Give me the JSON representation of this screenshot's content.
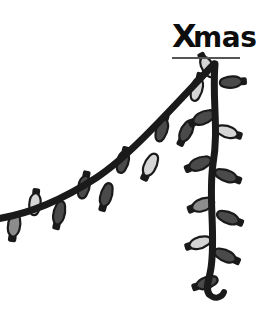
{
  "figure": {
    "background_color": "#ffffff",
    "ink_color": "#1a1a1a",
    "underline_color": "#555555",
    "bulb_light_color": "#d5d5d5",
    "bulb_mid_color": "#8c8c8c",
    "bulb_dark_color": "#4a4a4a",
    "label": {
      "text": "Xmas",
      "lead_char": "X",
      "rest_chars": "mas",
      "x": 172,
      "y": 47,
      "font_size": 28,
      "lead_font_size": 32
    },
    "baseline_rule": {
      "x1": 172,
      "x2": 240,
      "y": 58,
      "thickness": 2
    }
  },
  "chart_data": {
    "type": "line",
    "xlabel": "",
    "ylabel": "",
    "annotations": [
      "Xmas"
    ],
    "legend": [],
    "grid": false,
    "style": "hand-drawn christmas light string",
    "series": [
      {
        "name": "Christmas spirit",
        "x": [
          0,
          30,
          60,
          95,
          130,
          165,
          200,
          216,
          216,
          216,
          216,
          216,
          216
        ],
        "y": [
          218,
          207,
          190,
          168,
          148,
          120,
          80,
          62,
          110,
          160,
          210,
          260,
          298
        ],
        "values": [
          218,
          207,
          190,
          168,
          148,
          120,
          80,
          62,
          110,
          160,
          210,
          260,
          298
        ]
      }
    ],
    "peak": {
      "x": 216,
      "y": 62,
      "label": "Xmas"
    },
    "xlim": [
      0,
      265
    ],
    "ylim": [
      316,
      0
    ]
  },
  "wire": {
    "rise_path": "M -4 219 C 30 214, 62 200, 96 178 C 130 156, 170 110, 214 64",
    "fall_path": "M 215 64 C 212 100, 219 130, 213 164 C 208 198, 216 234, 211 268 C 209 281, 205 288, 209 294",
    "tail_path": "M 209 294 C 214 300, 222 298, 224 292",
    "thickness": 7
  },
  "bulbs_rise": [
    {
      "name": "bulb-rise-1",
      "x": 14,
      "y": 226,
      "angle": 188,
      "shade": "mid",
      "len": 26,
      "wid": 13
    },
    {
      "name": "bulb-rise-2",
      "x": 35,
      "y": 203,
      "angle": 6,
      "shade": "light",
      "len": 24,
      "wid": 12
    },
    {
      "name": "bulb-rise-3",
      "x": 59,
      "y": 214,
      "angle": 192,
      "shade": "dark",
      "len": 26,
      "wid": 12
    },
    {
      "name": "bulb-rise-4",
      "x": 84,
      "y": 186,
      "angle": 12,
      "shade": "dark",
      "len": 25,
      "wid": 12
    },
    {
      "name": "bulb-rise-5",
      "x": 106,
      "y": 196,
      "angle": 196,
      "shade": "dark",
      "len": 26,
      "wid": 12
    },
    {
      "name": "bulb-rise-6",
      "x": 123,
      "y": 161,
      "angle": 14,
      "shade": "dark",
      "len": 24,
      "wid": 12
    },
    {
      "name": "bulb-rise-7",
      "x": 150,
      "y": 166,
      "angle": 205,
      "shade": "light",
      "len": 26,
      "wid": 13
    },
    {
      "name": "bulb-rise-8",
      "x": 162,
      "y": 129,
      "angle": 16,
      "shade": "dark",
      "len": 25,
      "wid": 12
    },
    {
      "name": "bulb-rise-9",
      "x": 186,
      "y": 132,
      "angle": 206,
      "shade": "dark",
      "len": 25,
      "wid": 12
    },
    {
      "name": "bulb-rise-10",
      "x": 197,
      "y": 88,
      "angle": 14,
      "shade": "light",
      "len": 26,
      "wid": 12
    }
  ],
  "bulbs_fall": [
    {
      "name": "bulb-fall-1",
      "x": 207,
      "y": 66,
      "angle": 332,
      "shade": "light",
      "len": 24,
      "wid": 12
    },
    {
      "name": "bulb-fall-2",
      "x": 232,
      "y": 82,
      "angle": 86,
      "shade": "dark",
      "len": 24,
      "wid": 12
    },
    {
      "name": "bulb-fall-3",
      "x": 203,
      "y": 118,
      "angle": 246,
      "shade": "dark",
      "len": 25,
      "wid": 13
    },
    {
      "name": "bulb-fall-4",
      "x": 228,
      "y": 132,
      "angle": 108,
      "shade": "light",
      "len": 24,
      "wid": 12
    },
    {
      "name": "bulb-fall-5",
      "x": 199,
      "y": 164,
      "angle": 248,
      "shade": "dark",
      "len": 25,
      "wid": 13
    },
    {
      "name": "bulb-fall-6",
      "x": 227,
      "y": 176,
      "angle": 110,
      "shade": "dark",
      "len": 25,
      "wid": 12
    },
    {
      "name": "bulb-fall-7",
      "x": 202,
      "y": 205,
      "angle": 250,
      "shade": "mid",
      "len": 25,
      "wid": 13
    },
    {
      "name": "bulb-fall-8",
      "x": 229,
      "y": 218,
      "angle": 112,
      "shade": "dark",
      "len": 25,
      "wid": 12
    },
    {
      "name": "bulb-fall-9",
      "x": 199,
      "y": 243,
      "angle": 252,
      "shade": "light",
      "len": 24,
      "wid": 12
    },
    {
      "name": "bulb-fall-10",
      "x": 226,
      "y": 256,
      "angle": 114,
      "shade": "dark",
      "len": 25,
      "wid": 12
    },
    {
      "name": "bulb-fall-11",
      "x": 206,
      "y": 283,
      "angle": 250,
      "shade": "dark",
      "len": 24,
      "wid": 12
    }
  ]
}
